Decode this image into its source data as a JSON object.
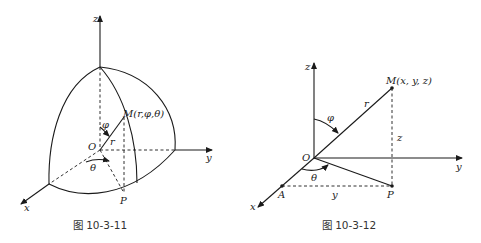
{
  "figures": [
    {
      "caption": "图 10-3-11",
      "labels": {
        "z": "z",
        "y": "y",
        "x": "x",
        "O": "O",
        "M": "M(r,φ,θ)",
        "r": "r",
        "phi": "φ",
        "theta": "θ",
        "P": "P"
      }
    },
    {
      "caption": "图 10-3-12",
      "labels": {
        "z": "z",
        "y": "y",
        "x": "x",
        "O": "O",
        "M": "M(x, y, z)",
        "r": "r",
        "phi": "φ",
        "theta": "θ",
        "z_len": "z",
        "y_len": "y",
        "A": "A",
        "P": "P"
      }
    }
  ]
}
